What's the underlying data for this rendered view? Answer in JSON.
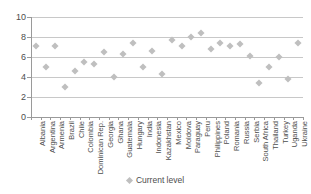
{
  "chart_data": {
    "type": "scatter",
    "title": "",
    "xlabel": "",
    "ylabel": "",
    "ylim": [
      0,
      10
    ],
    "yticks": [
      0,
      2,
      4,
      6,
      8,
      10
    ],
    "grid": true,
    "legend_position": "bottom",
    "categories": [
      "Albania",
      "Argentina",
      "Armenia",
      "Brazil",
      "Chile",
      "Colombia",
      "Dominican Rep.",
      "Georgia",
      "Ghana",
      "Guatemala",
      "Hungary",
      "India",
      "Indonesia",
      "Kazakhstan",
      "Mexico",
      "Moldova",
      "Paraguay",
      "Peru",
      "Philippines",
      "Poland",
      "Romania",
      "Russia",
      "Serbia",
      "South Africa",
      "Thailand",
      "Turkey",
      "Uganda",
      "Ukraine"
    ],
    "series": [
      {
        "name": "Current level",
        "marker": "diamond",
        "color": "#bfbfbf",
        "values": [
          7.1,
          5.0,
          7.1,
          3.0,
          4.6,
          5.5,
          5.3,
          6.5,
          4.0,
          6.3,
          7.4,
          5.0,
          6.6,
          4.3,
          7.7,
          7.1,
          8.0,
          8.4,
          6.8,
          7.4,
          7.1,
          7.3,
          6.1,
          3.4,
          5.0,
          6.0,
          3.8,
          7.4
        ]
      }
    ]
  },
  "legend": {
    "entries": [
      {
        "label": "Current level"
      }
    ]
  },
  "axis": {
    "y_tick_labels": [
      "10",
      "8",
      "6",
      "4",
      "2",
      "0"
    ]
  }
}
